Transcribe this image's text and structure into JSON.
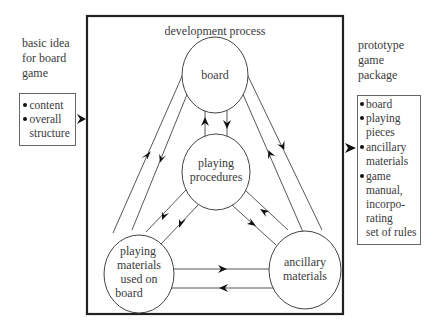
{
  "diagram": {
    "title": "development process",
    "input": {
      "label_lines": [
        "basic idea",
        "for board",
        "game"
      ],
      "items": [
        {
          "lines": [
            "content"
          ]
        },
        {
          "lines": [
            "overall",
            "structure"
          ]
        }
      ]
    },
    "output": {
      "label_lines": [
        "prototype",
        "game",
        "package"
      ],
      "items": [
        {
          "lines": [
            "board"
          ]
        },
        {
          "lines": [
            "playing",
            "pieces"
          ]
        },
        {
          "lines": [
            "ancillary",
            "materials"
          ]
        },
        {
          "lines": [
            "game",
            "manual,",
            "incorpo-",
            "rating",
            "set of rules"
          ]
        }
      ]
    },
    "nodes": [
      {
        "id": "board",
        "lines": [
          "board"
        ]
      },
      {
        "id": "playing-procedures",
        "lines": [
          "playing",
          "procedures"
        ]
      },
      {
        "id": "playing-materials",
        "lines": [
          "playing",
          "materials",
          "used on",
          "board"
        ]
      },
      {
        "id": "ancillary-materials",
        "lines": [
          "ancillary",
          "materials"
        ]
      }
    ],
    "edges": [
      {
        "from": "board",
        "to": "playing-procedures"
      },
      {
        "from": "playing-procedures",
        "to": "board"
      },
      {
        "from": "board",
        "to": "playing-materials"
      },
      {
        "from": "playing-materials",
        "to": "board"
      },
      {
        "from": "board",
        "to": "ancillary-materials"
      },
      {
        "from": "ancillary-materials",
        "to": "board"
      },
      {
        "from": "playing-procedures",
        "to": "playing-materials"
      },
      {
        "from": "playing-materials",
        "to": "playing-procedures"
      },
      {
        "from": "playing-procedures",
        "to": "ancillary-materials"
      },
      {
        "from": "ancillary-materials",
        "to": "playing-procedures"
      },
      {
        "from": "playing-materials",
        "to": "ancillary-materials"
      },
      {
        "from": "ancillary-materials",
        "to": "playing-materials"
      }
    ]
  }
}
